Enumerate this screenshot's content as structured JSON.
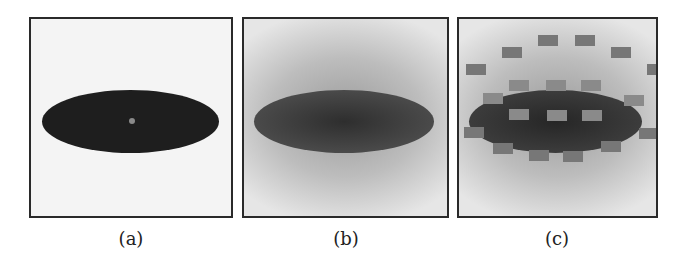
{
  "figure": {
    "panels": [
      {
        "id": "a",
        "label": "(a)",
        "description": "dark ellipse on light background with small grey center dot"
      },
      {
        "id": "b",
        "label": "(b)",
        "description": "blurred ellipse on radial gradient background"
      },
      {
        "id": "c",
        "label": "(c)",
        "description": "blurred ellipse with grid of grey rectangles inside and ring of rectangles around"
      }
    ],
    "panel_c_rects": [
      {
        "x": 79,
        "y": 16,
        "in": false
      },
      {
        "x": 116,
        "y": 16,
        "in": false
      },
      {
        "x": 43,
        "y": 28,
        "in": false
      },
      {
        "x": 152,
        "y": 28,
        "in": false
      },
      {
        "x": 7,
        "y": 45,
        "in": false
      },
      {
        "x": 188,
        "y": 45,
        "in": false
      },
      {
        "x": 50,
        "y": 61,
        "in": true
      },
      {
        "x": 87,
        "y": 61,
        "in": true
      },
      {
        "x": 122,
        "y": 61,
        "in": true
      },
      {
        "x": 24,
        "y": 74,
        "in": true
      },
      {
        "x": 165,
        "y": 76,
        "in": true
      },
      {
        "x": 50,
        "y": 90,
        "in": true
      },
      {
        "x": 88,
        "y": 91,
        "in": true
      },
      {
        "x": 123,
        "y": 91,
        "in": true
      },
      {
        "x": 5,
        "y": 108,
        "in": false
      },
      {
        "x": 180,
        "y": 109,
        "in": false
      },
      {
        "x": 34,
        "y": 124,
        "in": false
      },
      {
        "x": 142,
        "y": 122,
        "in": false
      },
      {
        "x": 70,
        "y": 131,
        "in": false
      },
      {
        "x": 104,
        "y": 132,
        "in": false
      }
    ]
  }
}
